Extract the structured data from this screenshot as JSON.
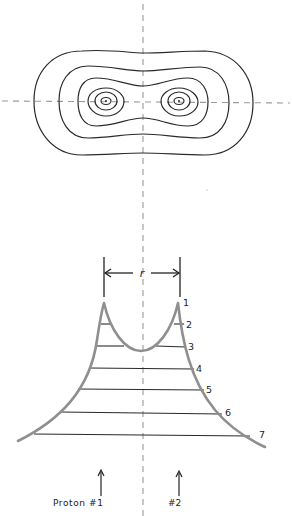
{
  "figure": {
    "colors": {
      "contour": "#2a2a2a",
      "axis_dash": "#9a9a9a",
      "curve": "#8f8f8f",
      "level_line": "#2a2a2a",
      "text": "#222222"
    }
  },
  "top_panel": {
    "type": "contour-map",
    "contour_count": 6,
    "nuclei": [
      {
        "name": "proton-1",
        "x": 106,
        "y": 101
      },
      {
        "name": "proton-2",
        "x": 179,
        "y": 101
      }
    ]
  },
  "bottom_panel": {
    "type": "potential-well",
    "distance_label": "r",
    "levels": [
      {
        "label": "1"
      },
      {
        "label": "2"
      },
      {
        "label": "3"
      },
      {
        "label": "4"
      },
      {
        "label": "5"
      },
      {
        "label": "6"
      },
      {
        "label": "7"
      }
    ]
  },
  "protons": {
    "proton1_label": "Proton #1",
    "proton2_label": "#2"
  }
}
